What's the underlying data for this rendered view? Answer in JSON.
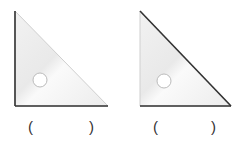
{
  "figures": [
    {
      "label": "set-square-1",
      "dark_edges": [
        "vertical",
        "bottom"
      ],
      "answer_open": "(",
      "answer_close": ")",
      "answer_value": ""
    },
    {
      "label": "set-square-2",
      "dark_edges": [
        "hypotenuse",
        "bottom"
      ],
      "answer_open": "(",
      "answer_close": ")",
      "answer_value": ""
    }
  ],
  "colors": {
    "fill": "#efefef",
    "dark_edge": "#333333",
    "light_edge": "#cfcfcf"
  }
}
